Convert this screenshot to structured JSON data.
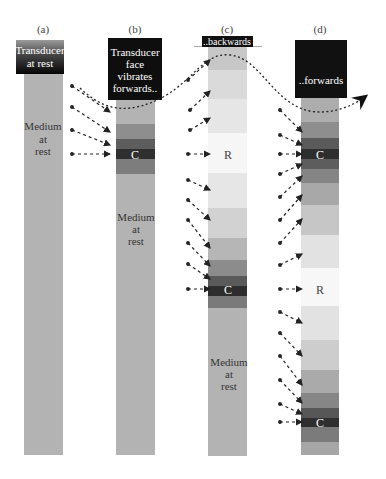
{
  "panels": [
    {
      "id": "a",
      "label": "(a)",
      "transducer_text": [
        "Transducer",
        "at rest"
      ],
      "medium_text": [
        "Medium",
        "at",
        "rest"
      ]
    },
    {
      "id": "b",
      "label": "(b)",
      "transducer_text": [
        "Transducer",
        "face",
        "vibrates",
        "forwards.."
      ],
      "compression_label": "C",
      "medium_text": [
        "Medium",
        "at",
        "rest"
      ]
    },
    {
      "id": "c",
      "label": "(c)",
      "transducer_text": [
        "..backwards"
      ],
      "rarefaction_label": "R",
      "compression_label": "C",
      "medium_text": [
        "Medium",
        "at",
        "rest"
      ]
    },
    {
      "id": "d",
      "label": "(d)",
      "transducer_text": [
        "..forwards"
      ],
      "compression_label_top": "C",
      "rarefaction_label": "R",
      "compression_label_bottom": "C"
    }
  ],
  "colors": {
    "medium_rest": "#b3b3b3",
    "compression_dark": "#333333",
    "rarefaction_light": "#f7f7f7",
    "transducer": "#111111",
    "arrow": "#222222"
  }
}
